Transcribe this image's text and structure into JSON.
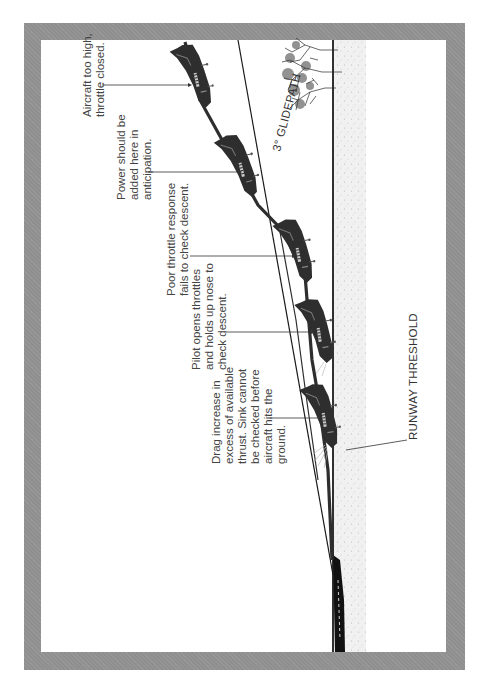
{
  "diagram": {
    "orientation": "rotated-90-ccw",
    "colors": {
      "frame": "#8f8f8f",
      "background": "#ffffff",
      "aircraft": "#2e2e2e",
      "lines": "#1a1a1a",
      "ground": "#ececec",
      "text": "#444444"
    },
    "labels": {
      "glidepath": "3° GLIDEPATH",
      "runway_threshold": "RUNWAY THRESHOLD"
    },
    "annotations": [
      {
        "id": "a1",
        "lines": [
          "Aircraft too high,",
          "throttle closed."
        ]
      },
      {
        "id": "a2",
        "lines": [
          "Power should be",
          "added here in",
          "anticipation."
        ]
      },
      {
        "id": "a3",
        "lines": [
          "Poor throttle response",
          "fails to check descent."
        ]
      },
      {
        "id": "a4",
        "lines": [
          "Pilot opens throttles",
          "and holds up nose to",
          "check descent."
        ]
      },
      {
        "id": "a5",
        "lines": [
          "Drag increase in",
          "excess of available",
          "thrust. Sink cannot",
          "be checked before",
          "aircraft hits the",
          "ground."
        ]
      }
    ]
  }
}
